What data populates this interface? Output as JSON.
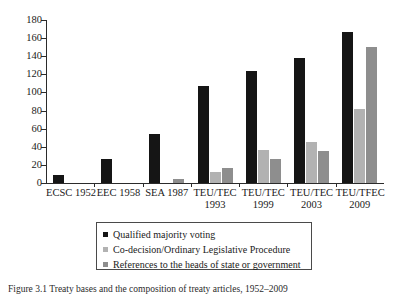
{
  "chart_data": {
    "type": "bar",
    "title": "",
    "xlabel": "",
    "ylabel": "",
    "ylim": [
      0,
      180
    ],
    "yticks": [
      0,
      20,
      40,
      60,
      80,
      100,
      120,
      140,
      160,
      180
    ],
    "grid": false,
    "legend_position": "bottom",
    "categories": [
      {
        "treaty": "ECSC 1952",
        "name": "ECSC",
        "year": "1952"
      },
      {
        "treaty": "EEC 1958",
        "name": "EEC",
        "year": "1958"
      },
      {
        "treaty": "SEA 1987",
        "name": "SEA",
        "year": "1987"
      },
      {
        "treaty": "TEU/TEC 1993",
        "name": "TEU/TEC",
        "year": "1993"
      },
      {
        "treaty": "TEU/TEC 1999",
        "name": "TEU/TEC",
        "year": "1999"
      },
      {
        "treaty": "TEU/TEC 2003",
        "name": "TEU/TEC",
        "year": "2003"
      },
      {
        "treaty": "TEU/TFEC 2009",
        "name": "TEU/TFEC",
        "year": "2009"
      }
    ],
    "series": [
      {
        "name": "Qualified majority voting",
        "color": "#151515",
        "values": [
          9,
          27,
          54,
          107,
          124,
          138,
          167
        ]
      },
      {
        "name": "Co-decision/Ordinary Legislative Procedure",
        "color": "#b2b2b2",
        "values": [
          0,
          0,
          0,
          12,
          37,
          45,
          82
        ]
      },
      {
        "name": "References to the heads of state or government",
        "color": "#8e8e8e",
        "values": [
          0,
          0,
          4,
          17,
          27,
          35,
          150
        ]
      }
    ]
  },
  "caption": "Figure 3.1 Treaty bases and the composition of treaty articles, 1952–2009"
}
